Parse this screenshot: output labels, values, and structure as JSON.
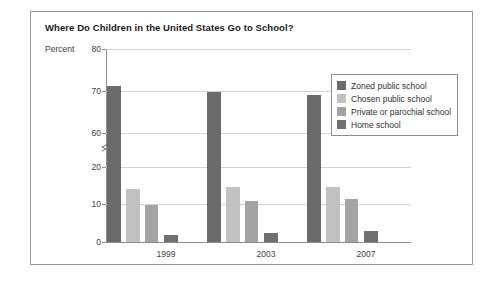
{
  "figure": {
    "title": "Where Do Children in the United States Go to School?"
  },
  "chart_data": {
    "type": "bar",
    "title": "Where Do Children in the United States Go to School?",
    "xlabel": "",
    "ylabel": "Percent",
    "categories": [
      "1999",
      "2003",
      "2007"
    ],
    "series": [
      {
        "name": "Zoned public school",
        "values": [
          73,
          71.5,
          70.5
        ],
        "color": "#6b6b6b"
      },
      {
        "name": "Chosen public school",
        "values": [
          14.5,
          15,
          15
        ],
        "color": "#c2c2c2"
      },
      {
        "name": "Private or parochial school",
        "values": [
          10,
          11,
          11.5
        ],
        "color": "#a3a3a3"
      },
      {
        "name": "Home school",
        "values": [
          1.7,
          2.2,
          2.9
        ],
        "color": "#6f6f6f"
      }
    ],
    "ytick_labels": [
      "0",
      "10",
      "20",
      "60",
      "70",
      "80"
    ],
    "ylim": [
      0,
      80
    ],
    "axis_break": true,
    "axis_break_between": [
      20,
      60
    ],
    "grid": "horizontal",
    "legend_position": "upper-right"
  },
  "axis": {
    "percent_label": "Percent",
    "ticks": [
      {
        "label": "80",
        "top": 0
      },
      {
        "label": "70",
        "top": 42
      },
      {
        "label": "60",
        "top": 84
      },
      {
        "label": "20",
        "top": 118
      },
      {
        "label": "10",
        "top": 155
      },
      {
        "label": "0",
        "top": 193
      }
    ],
    "x_ticks": [
      {
        "label": "1999",
        "center": 60
      },
      {
        "label": "2003",
        "center": 160
      },
      {
        "label": "2007",
        "center": 260
      }
    ]
  },
  "legend": {
    "items": [
      {
        "label": "Zoned public school",
        "color": "#6b6b6b"
      },
      {
        "label": "Chosen public school",
        "color": "#c2c2c2"
      },
      {
        "label": "Private or parochial school",
        "color": "#a3a3a3"
      },
      {
        "label": "Home school",
        "color": "#6f6f6f"
      }
    ]
  },
  "bars": [
    {
      "series": 0,
      "group": 0,
      "label": "Zoned public school 1999",
      "left": 1,
      "width": 14,
      "height": 156
    },
    {
      "series": 1,
      "group": 0,
      "label": "Chosen public school 1999",
      "left": 20,
      "width": 14,
      "height": 53
    },
    {
      "series": 2,
      "group": 0,
      "label": "Private or parochial school 1999",
      "left": 39,
      "width": 13,
      "height": 37
    },
    {
      "series": 3,
      "group": 0,
      "label": "Home school 1999",
      "left": 58,
      "width": 14,
      "height": 7
    },
    {
      "series": 0,
      "group": 1,
      "label": "Zoned public school 2003",
      "left": 101,
      "width": 14,
      "height": 150
    },
    {
      "series": 1,
      "group": 1,
      "label": "Chosen public school 2003",
      "left": 120,
      "width": 14,
      "height": 55
    },
    {
      "series": 2,
      "group": 1,
      "label": "Private or parochial school 2003",
      "left": 139,
      "width": 13,
      "height": 41
    },
    {
      "series": 3,
      "group": 1,
      "label": "Home school 2003",
      "left": 158,
      "width": 14,
      "height": 9
    },
    {
      "series": 0,
      "group": 2,
      "label": "Zoned public school 2007",
      "left": 201,
      "width": 14,
      "height": 147
    },
    {
      "series": 1,
      "group": 2,
      "label": "Chosen public school 2007",
      "left": 220,
      "width": 14,
      "height": 55
    },
    {
      "series": 2,
      "group": 2,
      "label": "Private or parochial school 2007",
      "left": 239,
      "width": 13,
      "height": 43
    },
    {
      "series": 3,
      "group": 2,
      "label": "Home school 2007",
      "left": 258,
      "width": 14,
      "height": 11
    }
  ]
}
